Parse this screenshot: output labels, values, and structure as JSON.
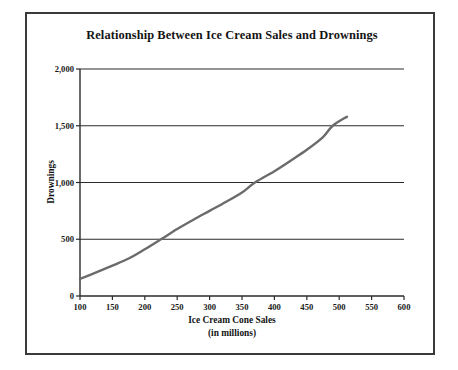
{
  "figure": {
    "background_color": "#ffffff",
    "frame_color": "#3a3a3a"
  },
  "chart_data": {
    "type": "line",
    "title": "Relationship Between Ice Cream Sales and Drownings",
    "xlabel": "Ice Cream Cone Sales",
    "xlabel_sub": "(in millions)",
    "ylabel": "Drownings",
    "xlim": [
      100,
      600
    ],
    "ylim": [
      0,
      2000
    ],
    "grid": "horizontal",
    "legend": "none",
    "line_color": "#6b6b6b",
    "x_ticks": [
      100,
      150,
      200,
      250,
      300,
      350,
      400,
      450,
      500,
      550,
      600
    ],
    "x_tick_labels": [
      "100",
      "150",
      "200",
      "250",
      "300",
      "350",
      "400",
      "450",
      "500",
      "550",
      "600"
    ],
    "y_ticks": [
      0,
      500,
      1000,
      1500,
      2000
    ],
    "y_tick_labels": [
      "0",
      "500",
      "1,000",
      "1,500",
      "2,000"
    ],
    "series": [
      {
        "name": "Drownings vs Ice Cream Cone Sales",
        "x": [
          100,
          125,
          150,
          175,
          200,
          225,
          250,
          275,
          300,
          325,
          350,
          370,
          400,
          425,
          450,
          475,
          490,
          512
        ],
        "values": [
          150,
          208,
          268,
          330,
          412,
          500,
          590,
          672,
          750,
          828,
          912,
          1000,
          1100,
          1192,
          1288,
          1400,
          1500,
          1580
        ]
      }
    ],
    "annotations": []
  }
}
